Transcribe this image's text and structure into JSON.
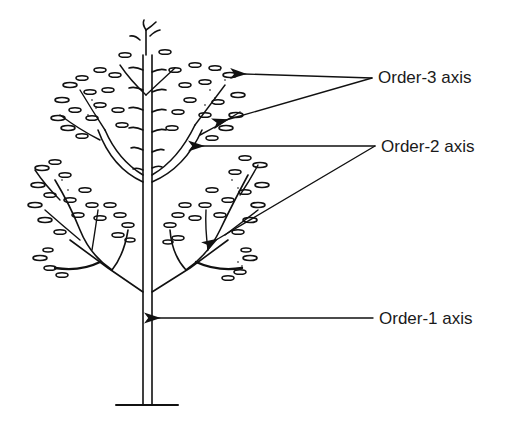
{
  "diagram": {
    "labels": [
      {
        "id": "order-3",
        "text": "Order-3 axis"
      },
      {
        "id": "order-2",
        "text": "Order-2 axis"
      },
      {
        "id": "order-1",
        "text": "Order-1 axis"
      }
    ],
    "colors": {
      "ink": "#111111",
      "background": "#ffffff",
      "text": "#1a1a1a"
    }
  }
}
